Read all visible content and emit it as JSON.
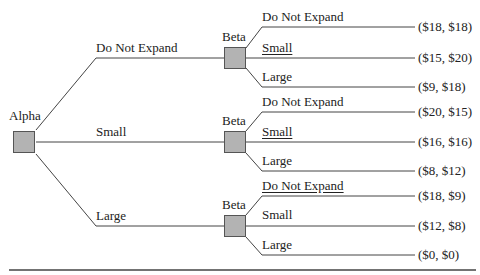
{
  "diagram": {
    "type": "game-tree",
    "root": {
      "player": "Alpha",
      "branches": [
        {
          "label": "Do Not Expand",
          "node": {
            "player": "Beta",
            "branches": [
              {
                "label": "Do Not Expand",
                "underlined": false,
                "payoff": "($18, $18)"
              },
              {
                "label": "Small",
                "underlined": true,
                "payoff": "($15, $20)"
              },
              {
                "label": "Large",
                "underlined": false,
                "payoff": "($9, $18)"
              }
            ]
          }
        },
        {
          "label": "Small",
          "node": {
            "player": "Beta",
            "branches": [
              {
                "label": "Do Not Expand",
                "underlined": false,
                "payoff": "($20, $15)"
              },
              {
                "label": "Small",
                "underlined": true,
                "payoff": "($16, $16)"
              },
              {
                "label": "Large",
                "underlined": false,
                "payoff": "($8, $12)"
              }
            ]
          }
        },
        {
          "label": "Large",
          "node": {
            "player": "Beta",
            "branches": [
              {
                "label": "Do Not Expand",
                "underlined": true,
                "payoff": "($18, $9)"
              },
              {
                "label": "Small",
                "underlined": false,
                "payoff": "($12, $8)"
              },
              {
                "label": "Large",
                "underlined": false,
                "payoff": "($0, $0)"
              }
            ]
          }
        }
      ]
    }
  }
}
